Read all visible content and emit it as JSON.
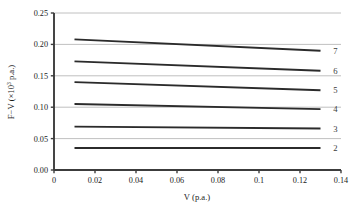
{
  "chart_data": {
    "type": "line",
    "title": "",
    "subtitle": "",
    "xlabel": "V (p.a.)",
    "ylabel": "F−V (×10³ p.a.)",
    "ylabel_parts": {
      "prefix": "F−V (×10",
      "exponent": "3",
      "suffix": " p.a.)"
    },
    "xlim": [
      0,
      0.14
    ],
    "ylim": [
      0,
      0.25
    ],
    "xticks": [
      0,
      0.02,
      0.04,
      0.06,
      0.08,
      0.1,
      0.12,
      0.14
    ],
    "xtick_labels": [
      "0",
      "0.02",
      "0.04",
      "0.06",
      "0.08",
      "0.1",
      "0.12",
      "0.14"
    ],
    "yticks": [
      0,
      0.05,
      0.1,
      0.15,
      0.2,
      0.25
    ],
    "ytick_labels": [
      "0.00",
      "0.05",
      "0.10",
      "0.15",
      "0.20",
      "0.25"
    ],
    "grid": {
      "horizontal": true,
      "vertical": false,
      "color": "#b9b9b9"
    },
    "legend_position": "right-inline",
    "line_color": "#2b2b2b",
    "axis_color": "#3c3c3c",
    "series": [
      {
        "name": "7",
        "label": "7",
        "x": [
          0.01,
          0.13
        ],
        "values": [
          0.208,
          0.19
        ]
      },
      {
        "name": "6",
        "label": "6",
        "x": [
          0.01,
          0.13
        ],
        "values": [
          0.173,
          0.158
        ]
      },
      {
        "name": "5",
        "label": "5",
        "x": [
          0.01,
          0.13
        ],
        "values": [
          0.14,
          0.127
        ]
      },
      {
        "name": "4",
        "label": "4",
        "x": [
          0.01,
          0.13
        ],
        "values": [
          0.105,
          0.097
        ]
      },
      {
        "name": "3",
        "label": "3",
        "x": [
          0.01,
          0.13
        ],
        "values": [
          0.069,
          0.066
        ]
      },
      {
        "name": "2",
        "label": "2",
        "x": [
          0.01,
          0.13
        ],
        "values": [
          0.035,
          0.035
        ]
      }
    ]
  }
}
